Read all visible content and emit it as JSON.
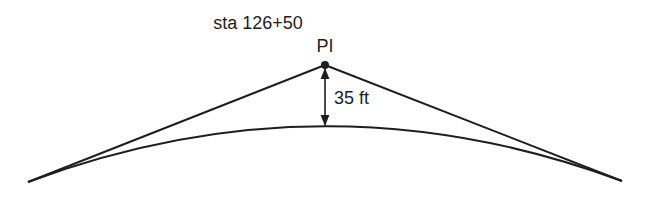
{
  "diagram": {
    "type": "vertical crest curve",
    "station_label": "sta 126+50",
    "pi_label": "PI",
    "external_distance_label": "35 ft",
    "colors": {
      "line": "#1e1e1e",
      "background": "#ffffff"
    }
  }
}
